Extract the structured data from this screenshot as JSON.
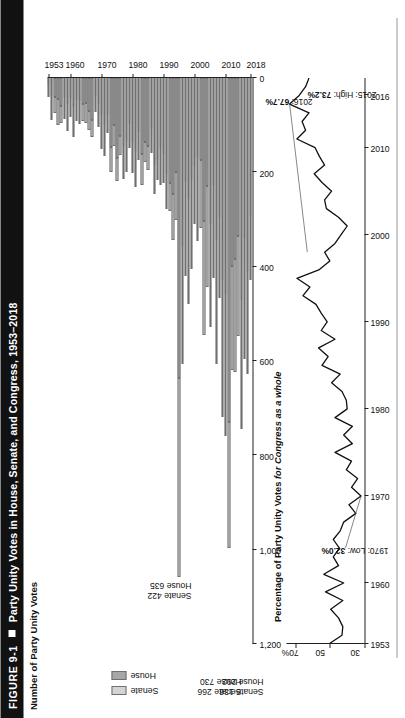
{
  "figure": {
    "number": "FIGURE 9-1",
    "bullet": "square-marker",
    "title": "Party Unity Votes in House, Senate, and Congress, 1953–2018"
  },
  "bar_panel": {
    "ylabel": "Number of Party Unity Votes",
    "legend": [
      {
        "label": "Senate",
        "color": "#d4d4d4"
      },
      {
        "label": "House",
        "color": "#a6a6a6"
      }
    ],
    "callouts": [
      {
        "line1": "Senate 136",
        "line2": "House 292",
        "year": 2018
      },
      {
        "line1": "Senate 266",
        "line2": "House 730",
        "year": 2011
      },
      {
        "line1": "Senate 422",
        "line2": "House 635",
        "year": 1995
      }
    ]
  },
  "line_panel": {
    "title_plain": "Percentage of Party Unity Votes ",
    "title_italic": "for Congress as a whole",
    "annotations": [
      {
        "text_plain": "2016: ",
        "text_bold": "67.7%",
        "year": 2016,
        "value": 67.7
      },
      {
        "text_plain": "2015: High: ",
        "text_bold": "73.2%",
        "year": 2015,
        "value": 73.2
      },
      {
        "text_plain": "1970: Low: ",
        "text_bold": "32.0%",
        "year": 1970,
        "value": 32.0
      }
    ]
  },
  "chart_data": [
    {
      "type": "bar",
      "id": "party-unity-vote-counts",
      "title": "Number of Party Unity Votes",
      "xlabel": "",
      "ylabel": "Number of Party Unity Votes",
      "orientation": "horizontal",
      "stacked": true,
      "value_axis_ticks": [
        "0",
        "200",
        "400",
        "600",
        "800",
        "1,000",
        "1,200"
      ],
      "value_axis_tick_values": [
        0,
        200,
        400,
        600,
        800,
        1000,
        1200
      ],
      "ylim": [
        0,
        1200
      ],
      "category_axis_ticks": [
        "1953",
        "1960",
        "1970",
        "1980",
        "1990",
        "2000",
        "2010",
        "2018"
      ],
      "grid": false,
      "legend_position": "left",
      "categories": [
        1953,
        1954,
        1955,
        1956,
        1957,
        1958,
        1959,
        1960,
        1961,
        1962,
        1963,
        1964,
        1965,
        1966,
        1967,
        1968,
        1969,
        1970,
        1971,
        1972,
        1973,
        1974,
        1975,
        1976,
        1977,
        1978,
        1979,
        1980,
        1981,
        1982,
        1983,
        1984,
        1985,
        1986,
        1987,
        1988,
        1989,
        1990,
        1991,
        1992,
        1993,
        1994,
        1995,
        1996,
        1997,
        1998,
        1999,
        2000,
        2001,
        2002,
        2003,
        2004,
        2005,
        2006,
        2007,
        2008,
        2009,
        2010,
        2011,
        2012,
        2013,
        2014,
        2015,
        2016,
        2017,
        2018
      ],
      "series": [
        {
          "name": "House",
          "color": "#a6a6a6",
          "values": [
            15,
            38,
            41,
            44,
            59,
            40,
            55,
            43,
            61,
            46,
            49,
            55,
            52,
            70,
            88,
            35,
            55,
            79,
            100,
            79,
            147,
            100,
            169,
            122,
            145,
            133,
            98,
            138,
            154,
            114,
            161,
            135,
            145,
            108,
            184,
            174,
            149,
            162,
            204,
            222,
            245,
            200,
            635,
            359,
            219,
            257,
            216,
            186,
            168,
            173,
            304,
            228,
            310,
            226,
            343,
            294,
            428,
            461,
            730,
            399,
            384,
            336,
            470,
            340,
            410,
            292
          ],
          "units": "roll-call votes"
        },
        {
          "name": "Senate",
          "color": "#d4d4d4",
          "values": [
            26,
            50,
            33,
            55,
            36,
            46,
            58,
            39,
            64,
            45,
            48,
            37,
            44,
            40,
            37,
            38,
            48,
            72,
            66,
            37,
            53,
            44,
            49,
            41,
            69,
            66,
            51,
            63,
            78,
            60,
            65,
            44,
            50,
            52,
            61,
            43,
            78,
            61,
            73,
            61,
            98,
            101,
            422,
            248,
            200,
            222,
            190,
            124,
            178,
            146,
            241,
            215,
            217,
            199,
            264,
            173,
            291,
            298,
            266,
            221,
            240,
            211,
            274,
            255,
            218,
            136
          ],
          "units": "roll-call votes"
        }
      ]
    },
    {
      "type": "line",
      "id": "party-unity-percentage",
      "title": "Percentage of Party Unity Votes for Congress as a whole",
      "xlabel": "",
      "ylabel": "",
      "ylim": [
        30,
        75
      ],
      "yticks": [
        30,
        50,
        70
      ],
      "ytick_labels": [
        "30",
        "50",
        "70%"
      ],
      "xlim": [
        1953,
        2018
      ],
      "xticks": [
        1953,
        1960,
        1970,
        1980,
        1990,
        2000,
        2010,
        2016
      ],
      "grid": false,
      "legend_position": "none",
      "x": [
        1953,
        1954,
        1955,
        1956,
        1957,
        1958,
        1959,
        1960,
        1961,
        1962,
        1963,
        1964,
        1965,
        1966,
        1967,
        1968,
        1969,
        1970,
        1971,
        1972,
        1973,
        1974,
        1975,
        1976,
        1977,
        1978,
        1979,
        1980,
        1981,
        1982,
        1983,
        1984,
        1985,
        1986,
        1987,
        1988,
        1989,
        1990,
        1991,
        1992,
        1993,
        1994,
        1995,
        1996,
        1997,
        1998,
        1999,
        2000,
        2001,
        2002,
        2003,
        2004,
        2005,
        2006,
        2007,
        2008,
        2009,
        2010,
        2011,
        2012,
        2013,
        2014,
        2015,
        2016,
        2017,
        2018
      ],
      "y": [
        50.6,
        43.0,
        42.5,
        45.0,
        49.5,
        42.5,
        52.5,
        42.0,
        53.5,
        45.0,
        48.0,
        44.5,
        48.0,
        44.0,
        42.0,
        35.0,
        39.0,
        32.0,
        37.5,
        34.0,
        40.5,
        37.5,
        47.0,
        37.0,
        42.0,
        37.0,
        47.0,
        40.0,
        40.5,
        43.0,
        49.0,
        44.0,
        54.5,
        51.0,
        56.5,
        47.0,
        55.0,
        51.5,
        55.0,
        58.0,
        65.5,
        61.5,
        69.0,
        56.0,
        50.0,
        53.0,
        47.0,
        43.5,
        40.0,
        45.0,
        52.0,
        53.0,
        49.0,
        54.5,
        59.0,
        53.0,
        56.0,
        58.5,
        69.0,
        64.0,
        66.0,
        62.0,
        73.2,
        67.7,
        64.0,
        62.0
      ]
    }
  ]
}
